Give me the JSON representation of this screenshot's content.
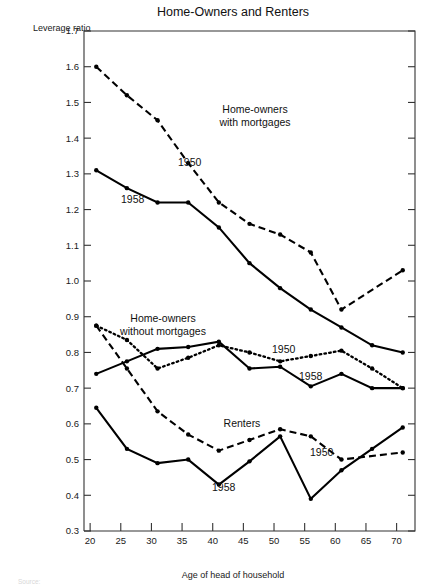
{
  "chart_data": {
    "type": "line",
    "title": "Home-Owners and Renters",
    "xlabel": "Age of head of household",
    "ylabel": "Leverage ratio",
    "xlim": [
      19,
      73
    ],
    "ylim": [
      0.3,
      1.7
    ],
    "xticks": [
      20,
      25,
      30,
      35,
      40,
      45,
      50,
      55,
      60,
      65,
      70
    ],
    "yticks": [
      0.3,
      0.4,
      0.5,
      0.6,
      0.7,
      0.8,
      0.9,
      1.0,
      1.1,
      1.2,
      1.3,
      1.4,
      1.5,
      1.6,
      1.7
    ],
    "grid": false,
    "legend": "inline-annotations",
    "groups": [
      {
        "name": "Home-owners with mortgages",
        "series": [
          {
            "name": "1950",
            "style": "dashed",
            "x": [
              21,
              26,
              31,
              36,
              41,
              46,
              51,
              56,
              61,
              71
            ],
            "y": [
              1.6,
              1.52,
              1.45,
              1.33,
              1.22,
              1.16,
              1.13,
              1.08,
              0.92,
              1.03
            ]
          },
          {
            "name": "1958",
            "style": "solid",
            "x": [
              21,
              26,
              31,
              36,
              41,
              46,
              51,
              56,
              61,
              66,
              71
            ],
            "y": [
              1.31,
              1.26,
              1.22,
              1.22,
              1.15,
              1.05,
              0.98,
              0.92,
              0.87,
              0.82,
              0.8
            ]
          }
        ]
      },
      {
        "name": "Home-owners without mortgages",
        "series": [
          {
            "name": "1950",
            "style": "dotted",
            "x": [
              21,
              26,
              31,
              36,
              41,
              46,
              51,
              56,
              61,
              66,
              71
            ],
            "y": [
              0.875,
              0.835,
              0.755,
              0.785,
              0.82,
              0.8,
              0.775,
              0.79,
              0.805,
              0.755,
              0.7
            ]
          },
          {
            "name": "1958",
            "style": "solid",
            "x": [
              21,
              26,
              31,
              36,
              41,
              46,
              51,
              56,
              61,
              66,
              71
            ],
            "y": [
              0.74,
              0.775,
              0.81,
              0.815,
              0.83,
              0.755,
              0.76,
              0.705,
              0.74,
              0.7,
              0.7
            ]
          }
        ]
      },
      {
        "name": "Renters",
        "series": [
          {
            "name": "1950",
            "style": "dashed",
            "x": [
              21,
              26,
              31,
              36,
              41,
              46,
              51,
              56,
              61,
              71
            ],
            "y": [
              0.875,
              0.755,
              0.635,
              0.57,
              0.525,
              0.555,
              0.585,
              0.565,
              0.5,
              0.52
            ]
          },
          {
            "name": "1958",
            "style": "solid",
            "x": [
              21,
              26,
              31,
              36,
              41,
              46,
              51,
              56,
              61,
              66,
              71
            ],
            "y": [
              0.645,
              0.53,
              0.49,
              0.5,
              0.43,
              0.495,
              0.565,
              0.39,
              0.47,
              0.53,
              0.59
            ]
          }
        ]
      }
    ],
    "annotations": [
      {
        "id": "mortgages-group-label",
        "text": "Home-owners\nwith mortgages",
        "x": 255,
        "y": 113,
        "anchor": "middle"
      },
      {
        "id": "mortgages-1950-label",
        "text": "1950",
        "x": 178,
        "y": 166,
        "anchor": "start"
      },
      {
        "id": "mortgages-1958-label",
        "text": "1958",
        "x": 121,
        "y": 203,
        "anchor": "start"
      },
      {
        "id": "without-mortgages-group-label",
        "text": "Home-owners\nwithout mortgages",
        "x": 163,
        "y": 322,
        "anchor": "middle"
      },
      {
        "id": "without-mortgages-1950-label",
        "text": "1950",
        "x": 272,
        "y": 353,
        "anchor": "start"
      },
      {
        "id": "without-mortgages-1958-label",
        "text": "1958",
        "x": 299,
        "y": 380,
        "anchor": "start"
      },
      {
        "id": "renters-group-label",
        "text": "Renters",
        "x": 242,
        "y": 427,
        "anchor": "middle"
      },
      {
        "id": "renters-1950-label",
        "text": "1950",
        "x": 310,
        "y": 456,
        "anchor": "start"
      },
      {
        "id": "renters-1958-label",
        "text": "1958",
        "x": 212,
        "y": 491,
        "anchor": "start"
      }
    ],
    "source_note": "Source:"
  }
}
